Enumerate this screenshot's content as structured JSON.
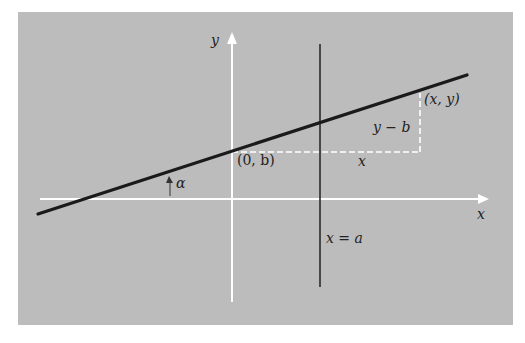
{
  "diagram": {
    "type": "coordinate-geometry-line",
    "colors": {
      "panel": "#bcbcbc",
      "axes": "#ffffff",
      "line": "#1a1a1a",
      "dashes": "#ffffff",
      "text": "#222222"
    },
    "labels": {
      "y_axis": "y",
      "x_axis": "x",
      "intercept": "(0, b)",
      "point": "(x, y)",
      "rise": "y − b",
      "run": "x",
      "angle": "α",
      "vertical_line": "x = a"
    }
  }
}
